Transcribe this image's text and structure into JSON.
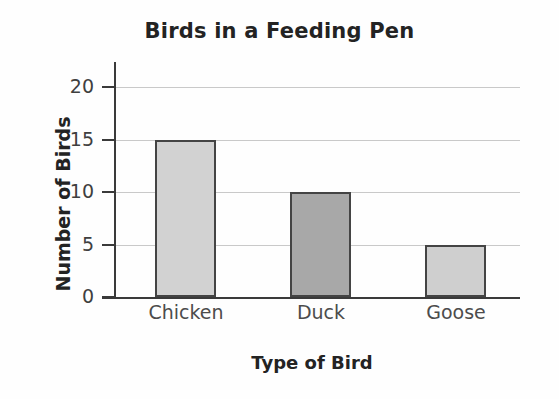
{
  "chart_data": {
    "type": "bar",
    "title": "Birds in a Feeding Pen",
    "xlabel": "Type of Bird",
    "ylabel": "Number of Birds",
    "categories": [
      "Chicken",
      "Duck",
      "Goose"
    ],
    "values": [
      15,
      10,
      5
    ],
    "bar_colors": [
      "#d2d2d2",
      "#a8a8a8",
      "#cfcfcf"
    ],
    "bar_edge_color": "#444444",
    "ylim": [
      0,
      20
    ],
    "yticks": [
      0,
      5,
      10,
      15,
      20
    ],
    "ytick_labels": [
      "0",
      "5",
      "10",
      "15",
      "20"
    ],
    "grid": true,
    "grid_color": "#c9c9c9",
    "legend": "none",
    "background": "#fefefe",
    "title_color": "#232323"
  }
}
